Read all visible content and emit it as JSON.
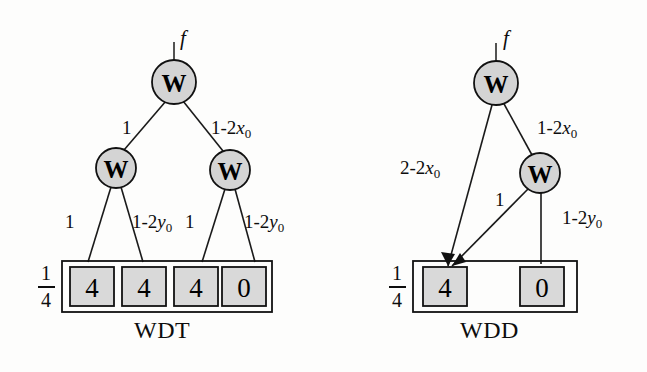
{
  "figure": {
    "background_color": "#fdfdfc",
    "node_fill": "#d4d4d4",
    "leaf_fill": "#d9d9d9",
    "stroke_color": "#111111"
  },
  "diagrams": [
    {
      "id": "wdt",
      "caption": "WDT",
      "root_input_label": "f",
      "scale_fraction": {
        "numerator": "1",
        "denominator": "4"
      },
      "nodes": [
        {
          "name": "root",
          "label": "W"
        },
        {
          "name": "left-mid",
          "label": "W"
        },
        {
          "name": "right-mid",
          "label": "W"
        }
      ],
      "edge_labels": [
        {
          "name": "root-left",
          "text": "1"
        },
        {
          "name": "root-right",
          "prefix": "1-2",
          "var": "x",
          "sub": "0"
        },
        {
          "name": "leftmid-left",
          "text": "1"
        },
        {
          "name": "leftmid-right",
          "prefix": "1-2",
          "var": "y",
          "sub": "0"
        },
        {
          "name": "rightmid-left",
          "text": "1"
        },
        {
          "name": "rightmid-right",
          "prefix": "1-2",
          "var": "y",
          "sub": "0"
        }
      ],
      "leaves": [
        {
          "name": "leaf-0",
          "value": "4"
        },
        {
          "name": "leaf-1",
          "value": "4"
        },
        {
          "name": "leaf-2",
          "value": "4"
        },
        {
          "name": "leaf-3",
          "value": "0"
        }
      ]
    },
    {
      "id": "wdd",
      "caption": "WDD",
      "root_input_label": "f",
      "scale_fraction": {
        "numerator": "1",
        "denominator": "4"
      },
      "nodes": [
        {
          "name": "root",
          "label": "W"
        },
        {
          "name": "mid",
          "label": "W"
        }
      ],
      "edge_labels": [
        {
          "name": "root-left",
          "prefix": "2-2",
          "var": "x",
          "sub": "0"
        },
        {
          "name": "root-right",
          "prefix": "1-2",
          "var": "x",
          "sub": "0"
        },
        {
          "name": "mid-left",
          "text": "1"
        },
        {
          "name": "mid-right",
          "prefix": "1-2",
          "var": "y",
          "sub": "0"
        }
      ],
      "leaves": [
        {
          "name": "leaf-0",
          "value": "4"
        },
        {
          "name": "leaf-1",
          "value": "0"
        }
      ]
    }
  ]
}
